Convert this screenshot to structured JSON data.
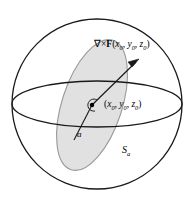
{
  "figure": {
    "type": "math-diagram",
    "background_color": "#ffffff",
    "line_color": "#1a1a1a",
    "disk_fill_color": "#dcdcdc",
    "disk_stroke_color": "#9a9a9a",
    "labels": {
      "curl_operator": "∇×",
      "curl_field": "F",
      "curl_args_open": "(",
      "curl_x": "x",
      "curl_x_sub": "0",
      "curl_comma1": ", ",
      "curl_y": "y",
      "curl_y_sub": "0",
      "curl_comma2": ", ",
      "curl_z": "z",
      "curl_z_sub": "0",
      "curl_args_close": ")",
      "point_open": "(",
      "point_x": "x",
      "point_x_sub": "0",
      "point_comma1": ", ",
      "point_y": "y",
      "point_y_sub": "0",
      "point_comma2": ", ",
      "point_z": "z",
      "point_z_sub": "0",
      "point_close": ")",
      "radius": "a",
      "surface": "S",
      "surface_sub": "a"
    },
    "geometry": {
      "sphere_center_x": 97,
      "sphere_center_y": 104,
      "sphere_radius": 85,
      "equator_rx": 85,
      "equator_ry": 23,
      "disk_center_x": 92,
      "disk_center_y": 105,
      "disk_rx": 30,
      "disk_ry": 68,
      "disk_rotation_deg": 18,
      "point_x": 92,
      "point_y": 105,
      "arrow_tip_x": 139,
      "arrow_tip_y": 59,
      "curl_circle_radius": 6
    }
  }
}
